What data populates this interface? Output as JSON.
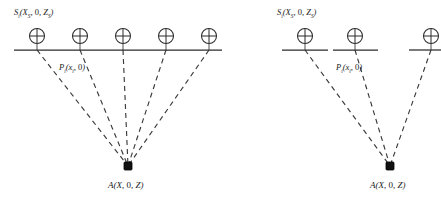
{
  "figure": {
    "background_color": "#ffffff",
    "ink_color": "#2b2b2b",
    "ray_color": "#3a3a3a",
    "target_color": "#111111"
  },
  "panels": [
    {
      "id": "left",
      "name": "dense-receiver-array-panel",
      "source_label": {
        "base": "S",
        "sub": "i",
        "args": "(X",
        "argsub": "S",
        "argmid": ", 0, Z",
        "argsub2": "S",
        "argend": ")"
      },
      "source_label_text": "Si(XS, 0, ZS)",
      "point_label_text": "Pi(xi, 0)",
      "target_label_text": "A(X, 0, Z)",
      "source_label_pos": {
        "x": 14,
        "y": 7
      },
      "point_label_pos": {
        "x": 59,
        "y": 62
      },
      "target_label_pos": {
        "x": 108,
        "y": 180
      },
      "ground_y": 50,
      "target": {
        "x": 128,
        "y": 166
      },
      "receivers": [
        {
          "x": 37,
          "y": 36,
          "r": 7.5,
          "seg_x1": 14,
          "seg_x2": 62
        },
        {
          "x": 80,
          "y": 36,
          "r": 7.5,
          "seg_x1": 62,
          "seg_x2": 104
        },
        {
          "x": 123,
          "y": 36,
          "r": 7.5,
          "seg_x1": 104,
          "seg_x2": 146
        },
        {
          "x": 166,
          "y": 36,
          "r": 7.5,
          "seg_x1": 146,
          "seg_x2": 188
        },
        {
          "x": 209,
          "y": 36,
          "r": 7.5,
          "seg_x1": 188,
          "seg_x2": 222
        }
      ]
    },
    {
      "id": "right",
      "name": "sparse-receiver-array-panel",
      "source_label_text": "Si(XS, 0, ZS)",
      "point_label_text": "Pi(xi, 0)",
      "target_label_text": "A(X, 0, Z)",
      "source_label_pos": {
        "x": 277,
        "y": 7
      },
      "point_label_pos": {
        "x": 336,
        "y": 62
      },
      "target_label_pos": {
        "x": 370,
        "y": 180
      },
      "ground_y": 50,
      "target": {
        "x": 390,
        "y": 166
      },
      "receivers": [
        {
          "x": 305,
          "y": 36,
          "r": 7.5,
          "seg_x1": 282,
          "seg_x2": 328
        },
        {
          "x": 355,
          "y": 36,
          "r": 7.5,
          "seg_x1": 333,
          "seg_x2": 378
        },
        {
          "x": 431,
          "y": 36,
          "r": 7.5,
          "seg_x1": 409,
          "seg_x2": 441
        }
      ]
    }
  ],
  "symbols": {
    "receiver_icon": "circled-plus-geophone-icon",
    "target_icon": "filled-square-target-icon"
  }
}
